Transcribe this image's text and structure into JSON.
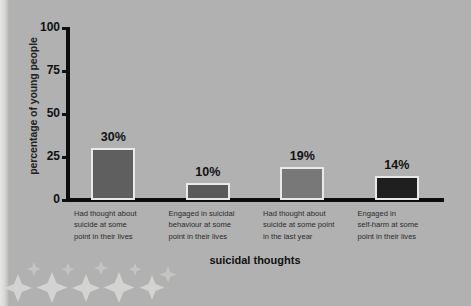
{
  "chart_data": {
    "type": "bar",
    "title": "",
    "xlabel": "suicidal thoughts",
    "ylabel": "percentage of young people",
    "ylim": [
      0,
      100
    ],
    "yticks": [
      "0",
      "25",
      "50",
      "75",
      "100"
    ],
    "ytick_values": [
      0,
      25,
      50,
      75,
      100
    ],
    "grid": false,
    "legend": "none",
    "categories": [
      "Had thought about suicide at some point in their lives",
      "Engaged in suicidal behaviour at some point in their lives",
      "Had thought about suicide at some point in the last year",
      "Engaged in self-harm at some point in their lives"
    ],
    "category_lines": [
      [
        "Had thought about",
        "suicide at some",
        "point in their lives"
      ],
      [
        "Engaged in suicidal",
        "behaviour at some",
        "point in their lives"
      ],
      [
        "Had thought about",
        "suicide at some point",
        "in the last year"
      ],
      [
        "Engaged in",
        "self-harm at some",
        "point in their lives"
      ]
    ],
    "values": [
      30,
      10,
      19,
      14
    ],
    "value_labels": [
      "30%",
      "10%",
      "19%",
      "14%"
    ],
    "bar_colors": [
      "#5f5f5f",
      "#5a5a5a",
      "#787878",
      "#1f1f1f"
    ],
    "bar_border_color": "#e9e9e7"
  },
  "decoration": {
    "top_sliver_text": "",
    "axis_color": "#0d0d0d",
    "background_color": "#b1b1b1"
  }
}
